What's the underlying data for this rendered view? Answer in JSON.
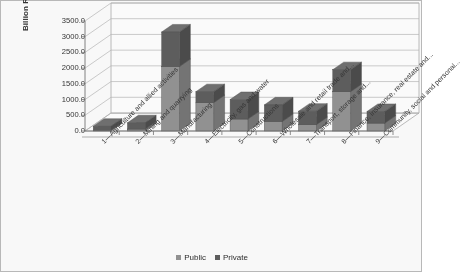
{
  "chart_data": {
    "type": "bar",
    "subtype": "stacked-3d-column",
    "title": "",
    "xlabel": "",
    "ylabel": "Billion Rs.",
    "ylim": [
      0,
      3500
    ],
    "ytick_labels": [
      "0.0",
      "500.0",
      "1000.0",
      "1500.0",
      "2000.0",
      "2500.0",
      "3000.0",
      "3500.0"
    ],
    "ytick_values": [
      0,
      500,
      1000,
      1500,
      2000,
      2500,
      3000,
      3500
    ],
    "grid": true,
    "legend_position": "bottom",
    "categories": [
      "1—Agriculture and allied activities",
      "2—Mining and quarrying",
      "3—Manufacturing",
      "4—Electricity, gas and water",
      "5—Constructions",
      "6—Wholesale and retail trade and...",
      "7—Transport, storage and...",
      "8—Finance, insurance, real estate and...",
      "9—Community, social and personal..."
    ],
    "series": [
      {
        "name": "Public",
        "color": "#8f8f8f",
        "values": [
          20,
          60,
          2050,
          900,
          380,
          300,
          200,
          1250,
          250
        ]
      },
      {
        "name": "Private",
        "color": "#585858",
        "values": [
          130,
          200,
          1100,
          350,
          620,
          530,
          430,
          700,
          370
        ]
      }
    ],
    "totals": [
      150,
      260,
      3150,
      1250,
      1000,
      830,
      630,
      1950,
      620
    ]
  },
  "legend": {
    "items": [
      {
        "label": "Public",
        "color": "#8f8f8f"
      },
      {
        "label": "Private",
        "color": "#585858"
      }
    ]
  }
}
